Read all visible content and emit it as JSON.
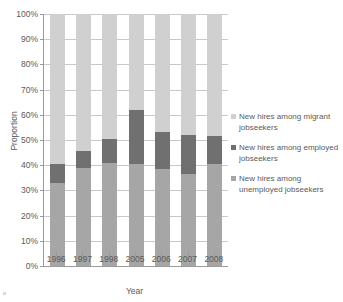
{
  "title": {
    "text": ""
  },
  "chart_data": {
    "type": "bar",
    "subtype": "stacked-bar-100-percent",
    "title": "",
    "xlabel": "Year",
    "ylabel": "Proportion",
    "categories": [
      "1996",
      "1997",
      "1998",
      "2005",
      "2006",
      "2007",
      "2008"
    ],
    "ylim": [
      0,
      100
    ],
    "ytick_labels": [
      "0%",
      "10%",
      "20%",
      "30%",
      "40%",
      "50%",
      "60%",
      "70%",
      "80%",
      "90%",
      "100%"
    ],
    "ytick_values": [
      0,
      10,
      20,
      30,
      40,
      50,
      60,
      70,
      80,
      90,
      100
    ],
    "grid": true,
    "legend_position": "right",
    "series": [
      {
        "name": "New hires among unemployed jobseekers",
        "color": "#a6a6a6",
        "values": [
          33.0,
          39.0,
          41.0,
          40.5,
          38.5,
          36.5,
          40.5
        ]
      },
      {
        "name": "New hires among employed jobseekers",
        "color": "#707070",
        "values": [
          7.5,
          6.5,
          9.5,
          21.5,
          14.5,
          15.5,
          11.0
        ]
      },
      {
        "name": "New hires among migrant jobseekers",
        "color": "#d0d0d0",
        "values": [
          59.5,
          54.5,
          49.5,
          38.0,
          47.0,
          48.0,
          48.5
        ]
      }
    ],
    "cumulative_tops": [
      {
        "category": "1996",
        "unemployed": 33.0,
        "plus_employed": 40.5,
        "total": 100
      },
      {
        "category": "1997",
        "unemployed": 39.0,
        "plus_employed": 45.5,
        "total": 100
      },
      {
        "category": "1998",
        "unemployed": 41.0,
        "plus_employed": 50.5,
        "total": 100
      },
      {
        "category": "2005",
        "unemployed": 40.5,
        "plus_employed": 62.0,
        "total": 100
      },
      {
        "category": "2006",
        "unemployed": 38.5,
        "plus_employed": 53.0,
        "total": 100
      },
      {
        "category": "2007",
        "unemployed": 36.5,
        "plus_employed": 52.0,
        "total": 100
      },
      {
        "category": "2008",
        "unemployed": 40.5,
        "plus_employed": 51.5,
        "total": 100
      }
    ]
  },
  "legend": {
    "items": [
      {
        "label": "New hires among migrant jobseekers",
        "color": "#d0d0d0"
      },
      {
        "label": "New hires among employed jobseekers",
        "color": "#707070"
      },
      {
        "label": "New hires among unemployed jobseekers",
        "color": "#a6a6a6"
      }
    ]
  },
  "colors": {
    "axis": "#9a9a9a",
    "gridline": "#c8c8c8",
    "text": "#5a5a5a",
    "background": "#ffffff"
  }
}
